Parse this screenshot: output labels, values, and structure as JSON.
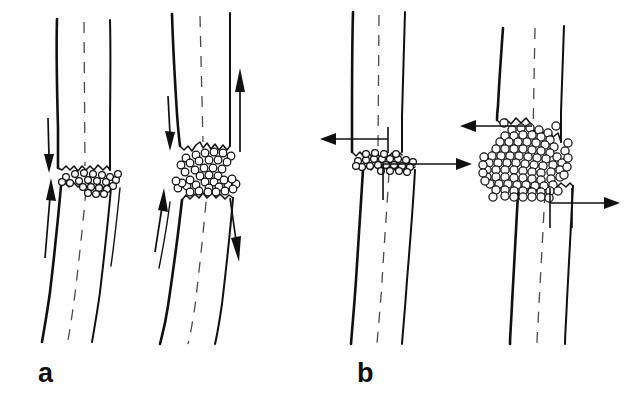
{
  "figure": {
    "background_color": "#fefefe",
    "ink_color": "#101010",
    "callus_fill": "#ffffff",
    "axis_color": "#4a4a4a",
    "width": 636,
    "height": 399
  },
  "panels": [
    {
      "id": "panel-a",
      "label": "a",
      "label_x": 38,
      "label_y": 382,
      "loading_mode": "axial-compression",
      "figures": [
        {
          "id": "a1",
          "name": "small-callus-axial",
          "gap_size": "narrow",
          "callus_density": "sparse",
          "callus_cell_count": 22,
          "arrows": [
            {
              "name": "axial-load-down-arrow",
              "direction": "down",
              "x": 48,
              "y1": 118,
              "y2": 170
            },
            {
              "name": "axial-load-up-arrow",
              "direction": "up",
              "x": 50,
              "y1": 255,
              "y2": 178
            }
          ]
        },
        {
          "id": "a2",
          "name": "large-callus-axial",
          "gap_size": "wide",
          "callus_density": "moderate",
          "callus_cell_count": 40,
          "arrows": [
            {
              "name": "axial-load-down-arrow",
              "direction": "down",
              "x": 170,
              "y1": 100,
              "y2": 152
            },
            {
              "name": "axial-load-up-arrow",
              "direction": "up",
              "x": 172,
              "y1": 250,
              "y2": 182
            },
            {
              "name": "far-cortex-up-arrow",
              "direction": "up",
              "x": 240,
              "y1": 150,
              "y2": 68
            },
            {
              "name": "far-cortex-down-arrow",
              "direction": "down",
              "x": 234,
              "y1": 200,
              "y2": 262
            }
          ]
        }
      ]
    },
    {
      "id": "panel-b",
      "label": "b",
      "label_x": 357,
      "label_y": 382,
      "loading_mode": "shear-translation",
      "figures": [
        {
          "id": "b1",
          "name": "small-callus-shear",
          "gap_size": "narrow",
          "callus_density": "sparse",
          "callus_cell_count": 24,
          "arrows": [
            {
              "name": "shear-load-left-arrow",
              "direction": "left",
              "y": 139,
              "x1": 388,
              "x2": 322
            },
            {
              "name": "shear-load-right-arrow",
              "direction": "right",
              "y": 164,
              "x1": 400,
              "x2": 472
            }
          ]
        },
        {
          "id": "b2",
          "name": "large-callus-shear",
          "gap_size": "wide",
          "callus_density": "dense",
          "callus_cell_count": 96,
          "arrows": [
            {
              "name": "shear-load-left-arrow",
              "direction": "left",
              "y": 126,
              "x1": 532,
              "x2": 462
            },
            {
              "name": "shear-load-right-arrow",
              "direction": "right",
              "y": 203,
              "x1": 550,
              "x2": 620
            }
          ]
        }
      ]
    }
  ],
  "legend_notes": {
    "callus_symbol": "open-circle",
    "centerline_symbol": "dashed-line",
    "arrow_symbol": "solid-triangular-arrowhead"
  }
}
